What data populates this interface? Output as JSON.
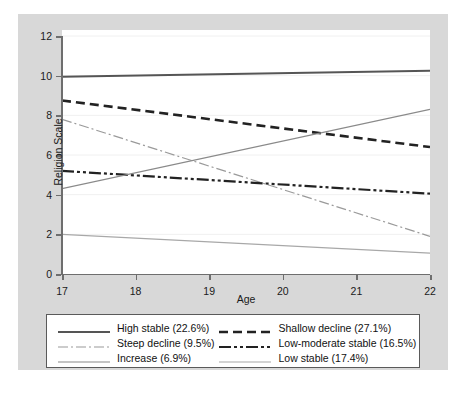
{
  "chart_data": {
    "type": "line",
    "title": "",
    "xlabel": "Age",
    "ylabel": "Religion Scale",
    "xlim": [
      17,
      22
    ],
    "ylim": [
      0,
      12
    ],
    "x": [
      17,
      22
    ],
    "xticks": [
      "17",
      "18",
      "19",
      "20",
      "21",
      "22"
    ],
    "yticks": [
      "0",
      "2",
      "4",
      "6",
      "8",
      "10",
      "12"
    ],
    "grid": "horizontal-light",
    "legend_position": "below-plot",
    "series": [
      {
        "name": "High stable (22.6%)",
        "label": "High stable (22.6%)",
        "values": [
          9.95,
          10.25
        ],
        "style": "solid",
        "color": "#555555",
        "width": 2.0,
        "dash": ""
      },
      {
        "name": "Shallow decline (27.1%)",
        "label": "Shallow decline (27.1%)",
        "values": [
          8.75,
          6.4
        ],
        "style": "dashed",
        "color": "#222222",
        "width": 2.6,
        "dash": "9,5"
      },
      {
        "name": "Steep decline (9.5%)",
        "label": "Steep decline (9.5%)",
        "values": [
          7.8,
          1.9
        ],
        "style": "dash-dot",
        "color": "#9a9a9a",
        "width": 1.2,
        "dash": "10,3,2,3"
      },
      {
        "name": "Low-moderate stable (16.5%)",
        "label": "Low-moderate stable (16.5%)",
        "values": [
          5.2,
          4.05
        ],
        "style": "dash-dot-dot",
        "color": "#222222",
        "width": 2.2,
        "dash": "12,3,3,3,3,3"
      },
      {
        "name": "Increase (6.9%)",
        "label": "Increase (6.9%)",
        "values": [
          4.3,
          8.3
        ],
        "style": "solid",
        "color": "#8a8a8a",
        "width": 1.2,
        "dash": ""
      },
      {
        "name": "Low stable (17.4%)",
        "label": "Low stable (17.4%)",
        "values": [
          2.0,
          1.05
        ],
        "style": "solid",
        "color": "#a8a8a8",
        "width": 1.2,
        "dash": ""
      }
    ]
  },
  "legend": {
    "items": [
      "High stable (22.6%)",
      "Shallow decline (27.1%)",
      "Steep decline (9.5%)",
      "Low-moderate stable (16.5%)",
      "Increase (6.9%)",
      "Low stable (17.4%)"
    ]
  },
  "colors": {
    "figure_background": "#d8d8d8",
    "plot_background": "#ffffff",
    "axis": "#6e6e6e",
    "gridline": "#f0f0f0",
    "text": "#1a1a1a",
    "legend_border": "#5a5a5a"
  }
}
